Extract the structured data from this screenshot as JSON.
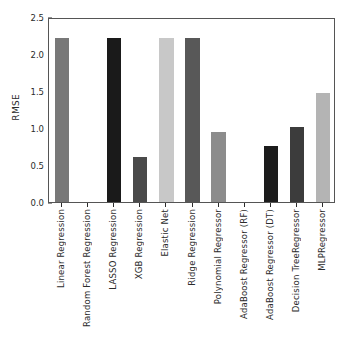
{
  "chart_data": {
    "type": "bar",
    "title": "",
    "xlabel": "",
    "ylabel": "RMSE",
    "ylim": [
      0.0,
      2.5
    ],
    "yticks": [
      "0.0",
      "0.5",
      "1.0",
      "1.5",
      "2.0",
      "2.5"
    ],
    "ytick_values": [
      0.0,
      0.5,
      1.0,
      1.5,
      2.0,
      2.5
    ],
    "grid": false,
    "legend": "none",
    "categories": [
      "Linear Regression",
      "Random Forest Regression",
      "LASSO Regression",
      "XGB Regression",
      "Elastic Net",
      "Ridge Regression",
      "Polynomial Regressor",
      "AdaBoost Regressor (RF)",
      "AdaBoost Regressor (DT)",
      "Decision TreeRegressor",
      "MLPRegressor"
    ],
    "values": [
      2.22,
      0.0,
      2.22,
      0.61,
      2.22,
      2.22,
      0.95,
      0.0,
      0.76,
      1.02,
      1.47
    ],
    "bar_colors": [
      "#787878",
      "#9a9a9a",
      "#1a1a1a",
      "#4a4a4a",
      "#c8c8c8",
      "#585858",
      "#8c8c8c",
      "#9a9a9a",
      "#1c1c1c",
      "#3c3c3c",
      "#b4b4b4"
    ]
  },
  "axes": {
    "frame_color": "#555555",
    "tick_color": "#2b2b2b"
  }
}
